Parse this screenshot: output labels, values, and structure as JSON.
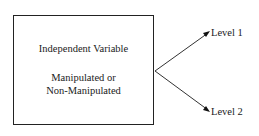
{
  "box": {
    "title": "Independent Variable",
    "line2": "Manipulated or",
    "line3": "Non-Manipulated"
  },
  "levels": [
    {
      "label": "Level 1"
    },
    {
      "label": "Level 2"
    }
  ]
}
